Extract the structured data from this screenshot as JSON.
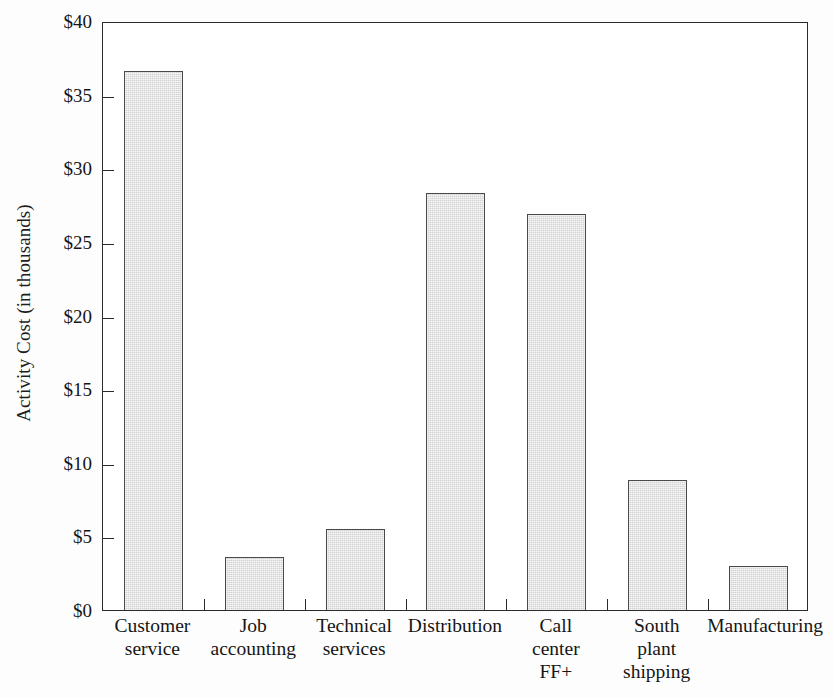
{
  "chart_data": {
    "type": "bar",
    "title": "",
    "xlabel": "",
    "ylabel": "Activity Cost (in thousands)",
    "ylim": [
      0,
      40
    ],
    "ytick_values": [
      0,
      5,
      10,
      15,
      20,
      25,
      30,
      35,
      40
    ],
    "ytick_labels": [
      "$0",
      "$5",
      "$10",
      "$15",
      "$20",
      "$25",
      "$30",
      "$35",
      "$40"
    ],
    "grid": false,
    "legend": false,
    "bar_fill_color": "#d2d2d2",
    "bar_edge_color": "#4a4a4a",
    "axis_color": "#2b2b2b",
    "categories": [
      "Customer service",
      "Job accounting",
      "Technical services",
      "Distribution",
      "Call center FF+",
      "South plant shipping",
      "Manufacturing"
    ],
    "category_label_lines": [
      [
        "Customer",
        "service"
      ],
      [
        "Job",
        "accounting"
      ],
      [
        "Technical",
        "services"
      ],
      [
        "Distribution"
      ],
      [
        "Call",
        "center",
        "FF+"
      ],
      [
        "South",
        "plant",
        "shipping"
      ],
      [
        "Manufacturing"
      ]
    ],
    "values": [
      36.6,
      3.6,
      5.5,
      28.3,
      26.9,
      8.8,
      3.0
    ]
  }
}
